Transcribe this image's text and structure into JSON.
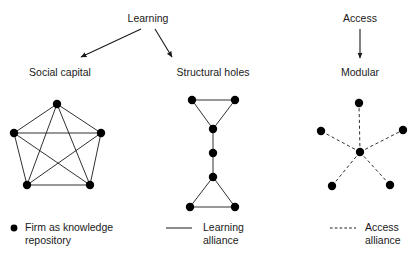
{
  "figure": {
    "title_drivers": [
      {
        "id": "learning",
        "label": "Learning",
        "x": 148,
        "y": 12
      },
      {
        "id": "access",
        "label": "Access",
        "x": 360,
        "y": 12
      }
    ],
    "network_labels": [
      {
        "id": "social-capital",
        "label": "Social capital",
        "x": 60,
        "y": 66
      },
      {
        "id": "structural-holes",
        "label": "Structural holes",
        "x": 213,
        "y": 66
      },
      {
        "id": "modular",
        "label": "Modular",
        "x": 360,
        "y": 66
      }
    ],
    "arrows": [
      {
        "id": "learning-to-social-capital",
        "x1": 141,
        "y1": 29,
        "x2": 81,
        "y2": 57
      },
      {
        "id": "learning-to-structural-holes",
        "x1": 155,
        "y1": 29,
        "x2": 172,
        "y2": 57
      },
      {
        "id": "access-to-modular",
        "x1": 360,
        "y1": 29,
        "x2": 360,
        "y2": 58
      }
    ],
    "legend": [
      {
        "id": "firm-node",
        "marker": "dot",
        "label": "Firm as knowledge\nrepository",
        "marker_x": 14,
        "marker_y": 228,
        "text_x": 25,
        "text_y": 221
      },
      {
        "id": "learning-alliance",
        "marker": "solid-line",
        "label": "Learning\nalliance",
        "marker_x": 166,
        "marker_y": 228,
        "text_x": 203,
        "text_y": 221
      },
      {
        "id": "access-alliance",
        "marker": "dashed-line",
        "label": "Access\nalliance",
        "marker_x": 330,
        "marker_y": 228,
        "text_x": 365,
        "text_y": 221
      }
    ]
  },
  "chart_data": {
    "type": "diagram",
    "style": {
      "node_color": "#000000",
      "node_radius": 4.2,
      "edge_color": "#1a1a1a",
      "edge_width": 0.9,
      "background": "#ffffff"
    },
    "networks": [
      {
        "id": "social-capital",
        "name": "Social capital",
        "driver": "Learning",
        "edge_style": "solid",
        "description": "Complete graph (K5): dense clique of five firms, every pair tied by a learning alliance.",
        "node_count": 5,
        "edge_count": 10,
        "nodes": [
          {
            "id": "sc-top",
            "x": 57,
            "y": 104
          },
          {
            "id": "sc-right",
            "x": 101,
            "y": 133
          },
          {
            "id": "sc-bottom-right",
            "x": 90,
            "y": 185
          },
          {
            "id": "sc-bottom-left",
            "x": 27,
            "y": 185
          },
          {
            "id": "sc-left",
            "x": 14,
            "y": 133
          }
        ],
        "edges": [
          [
            "sc-top",
            "sc-right"
          ],
          [
            "sc-right",
            "sc-bottom-right"
          ],
          [
            "sc-bottom-right",
            "sc-bottom-left"
          ],
          [
            "sc-bottom-left",
            "sc-left"
          ],
          [
            "sc-left",
            "sc-top"
          ],
          [
            "sc-top",
            "sc-bottom-right"
          ],
          [
            "sc-top",
            "sc-bottom-left"
          ],
          [
            "sc-right",
            "sc-bottom-left"
          ],
          [
            "sc-right",
            "sc-left"
          ],
          [
            "sc-bottom-right",
            "sc-left"
          ]
        ]
      },
      {
        "id": "structural-holes",
        "name": "Structural holes",
        "driver": "Learning",
        "edge_style": "solid",
        "description": "Two triangular clusters bridged by a chain of brokers spanning a structural hole.",
        "node_count": 8,
        "edge_count": 9,
        "nodes": [
          {
            "id": "sh-top-left",
            "x": 192,
            "y": 100
          },
          {
            "id": "sh-top-right",
            "x": 235,
            "y": 100
          },
          {
            "id": "sh-upper-apex",
            "x": 213,
            "y": 129
          },
          {
            "id": "sh-middle",
            "x": 213,
            "y": 153
          },
          {
            "id": "sh-lower-apex",
            "x": 213,
            "y": 177
          },
          {
            "id": "sh-bottom-left",
            "x": 190,
            "y": 207
          },
          {
            "id": "sh-bottom-right",
            "x": 235,
            "y": 207
          }
        ],
        "edges": [
          [
            "sh-top-left",
            "sh-top-right"
          ],
          [
            "sh-top-left",
            "sh-upper-apex"
          ],
          [
            "sh-top-right",
            "sh-upper-apex"
          ],
          [
            "sh-upper-apex",
            "sh-middle"
          ],
          [
            "sh-middle",
            "sh-lower-apex"
          ],
          [
            "sh-lower-apex",
            "sh-bottom-left"
          ],
          [
            "sh-lower-apex",
            "sh-bottom-right"
          ],
          [
            "sh-bottom-left",
            "sh-bottom-right"
          ]
        ]
      },
      {
        "id": "modular",
        "name": "Modular",
        "driver": "Access",
        "edge_style": "dashed",
        "description": "Star / hub-and-spoke: a central firm holds five access alliances with peripheral partners.",
        "node_count": 6,
        "edge_count": 5,
        "nodes": [
          {
            "id": "md-center",
            "x": 360,
            "y": 152
          },
          {
            "id": "md-top",
            "x": 359,
            "y": 103
          },
          {
            "id": "md-left",
            "x": 321,
            "y": 131
          },
          {
            "id": "md-right",
            "x": 403,
            "y": 130
          },
          {
            "id": "md-bottom-left",
            "x": 332,
            "y": 186
          },
          {
            "id": "md-bottom-right",
            "x": 390,
            "y": 185
          }
        ],
        "edges": [
          [
            "md-center",
            "md-top"
          ],
          [
            "md-center",
            "md-left"
          ],
          [
            "md-center",
            "md-right"
          ],
          [
            "md-center",
            "md-bottom-left"
          ],
          [
            "md-center",
            "md-bottom-right"
          ]
        ]
      }
    ]
  }
}
